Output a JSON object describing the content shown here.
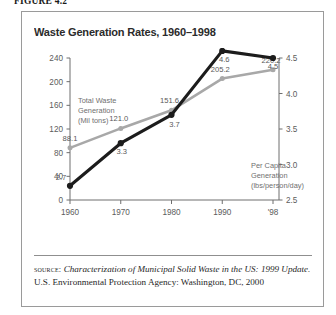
{
  "figure": {
    "label": "FIGURE 4.2"
  },
  "chart_title": "Waste Generation Rates, 1960–1998",
  "annotations": {
    "total": {
      "line1": "Total Waste",
      "line2": "Generation",
      "line3": "(Mil tons)"
    },
    "per_capita": {
      "line1": "Per Capita",
      "line2": "Generation",
      "line3": "(lbs/person/day)"
    }
  },
  "source": {
    "label": "source:",
    "title": "Characterization of Municipal Solid Waste in the US: 1999 Update.",
    "rest": " U.S. Environmental Protection Agency: Washington, DC, 2000"
  },
  "colors": {
    "total_waste_line": "#a8a8a8",
    "per_capita_line": "#1c1c1c",
    "axis": "#6e6e6e",
    "value_label": "#595959",
    "tick_label": "#5c5c5c",
    "frame": "#9a9a9a",
    "title": "#2b2b2b",
    "background": "#ffffff"
  },
  "chart_data": {
    "type": "line",
    "title": "Waste Generation Rates, 1960–1998",
    "xlabel": "",
    "grid": false,
    "legend_position": "inline-annotation",
    "x": [
      1960,
      1970,
      1980,
      1990,
      1998
    ],
    "tick_labels": [
      "1960",
      "1970",
      "1980",
      "1990",
      "'98"
    ],
    "axes": [
      {
        "id": "left",
        "ylabel": "Total Waste Generation (Mil tons)",
        "ylim": [
          0,
          240
        ],
        "ticks": [
          0,
          40,
          80,
          120,
          160,
          200,
          240
        ],
        "tick_labels": [
          "0",
          "40",
          "80",
          "120",
          "160",
          "200",
          "240"
        ]
      },
      {
        "id": "right",
        "ylabel": "Per Capita Generation (lbs/person/day)",
        "ylim": [
          2.5,
          4.5
        ],
        "ticks": [
          2.5,
          3.0,
          3.5,
          4.0,
          4.5
        ],
        "tick_labels": [
          "2.5",
          "3.0",
          "3.5",
          "4.0",
          "4.5"
        ]
      }
    ],
    "series": [
      {
        "name": "Total Waste Generation (Mil tons)",
        "axis": "left",
        "color": "#a8a8a8",
        "values": [
          88.1,
          121.0,
          151.6,
          205.2,
          220.2
        ],
        "data_labels": [
          "88.1",
          "121.0",
          "151.6",
          "205.2",
          "220.2"
        ]
      },
      {
        "name": "Per Capita Generation (lbs/person/day)",
        "axis": "right",
        "color": "#1c1c1c",
        "values": [
          2.7,
          3.3,
          3.7,
          4.6,
          4.5
        ],
        "data_labels": [
          "2.7",
          "3.3",
          "3.7",
          "4.6",
          "4.5"
        ]
      }
    ]
  }
}
